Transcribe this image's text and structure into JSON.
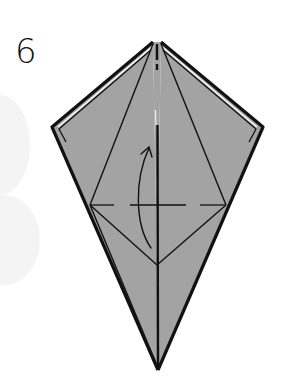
{
  "diagram": {
    "step_number": "6",
    "type": "origami-fold-instruction",
    "colors": {
      "paper_fill": "#a3a3a3",
      "line": "#111111",
      "background": "#ffffff",
      "background_blob": "#f3f3f3"
    },
    "points": {
      "top_left": [
        153,
        42
      ],
      "top_right": [
        161,
        42
      ],
      "left_corner": [
        52,
        127
      ],
      "right_corner": [
        263,
        127
      ],
      "mid_left": [
        90,
        205
      ],
      "mid_right": [
        226,
        205
      ],
      "center": [
        157,
        265
      ],
      "tip": [
        158,
        370
      ]
    },
    "fold": {
      "kind": "valley-fold",
      "line": "dashed horizontal at y=205",
      "arrow_direction": "up"
    }
  }
}
